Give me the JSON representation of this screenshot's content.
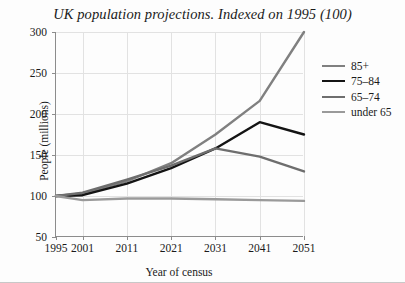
{
  "chart_data": {
    "type": "line",
    "title": "UK population projections. Indexed on 1995 (100)",
    "xlabel": "Year of census",
    "ylabel": "People (millions)",
    "x": [
      1995,
      2001,
      2011,
      2021,
      2031,
      2041,
      2051
    ],
    "xticklabels": [
      "1995",
      "2001",
      "2011",
      "2021",
      "2031",
      "2041",
      "2051"
    ],
    "yticklabels": [
      "50",
      "100",
      "150",
      "200",
      "250",
      "300"
    ],
    "yticks": [
      50,
      100,
      150,
      200,
      250,
      300
    ],
    "xlim": [
      1995,
      2051
    ],
    "ylim": [
      50,
      300
    ],
    "grid": true,
    "legend_position": "right",
    "series": [
      {
        "name": "85+",
        "color": "#808080",
        "width": 2.4,
        "values": [
          100,
          103,
          118,
          140,
          175,
          216,
          300
        ]
      },
      {
        "name": "75–84",
        "color": "#141414",
        "width": 2.4,
        "values": [
          100,
          101,
          115,
          134,
          158,
          190,
          175
        ]
      },
      {
        "name": "65–74",
        "color": "#6e6e6e",
        "width": 2.4,
        "values": [
          100,
          104,
          120,
          137,
          158,
          148,
          130
        ]
      },
      {
        "name": "under 65",
        "color": "#9a9a9a",
        "width": 2.4,
        "values": [
          100,
          95,
          97,
          97,
          96,
          95,
          94
        ]
      }
    ]
  },
  "legend": {
    "items": [
      {
        "label": "85+",
        "color": "#808080"
      },
      {
        "label": "75–84",
        "color": "#141414"
      },
      {
        "label": "65–74",
        "color": "#6e6e6e"
      },
      {
        "label": "under 65",
        "color": "#9a9a9a"
      }
    ]
  },
  "colors": {
    "axis": "#8c8c8c",
    "grid": "#e2e2e2",
    "text": "#1a1a1a",
    "background": "#fdfdfd"
  }
}
